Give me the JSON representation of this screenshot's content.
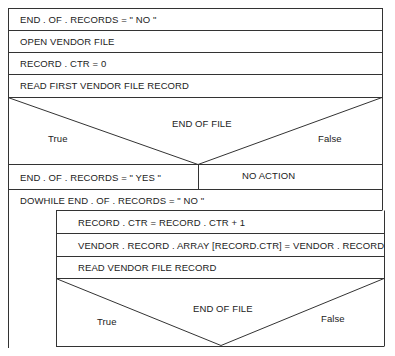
{
  "diagram": {
    "type": "Nassi-Shneiderman structured chart",
    "steps": [
      "END . OF . RECORDS = \" NO \"",
      "OPEN VENDOR FILE",
      "RECORD . CTR = 0",
      "READ FIRST  VENDOR FILE RECORD"
    ],
    "decision1": {
      "condition": "END OF FILE",
      "true_label": "True",
      "false_label": "False",
      "true_action": "END . OF . RECORDS = \" YES \"",
      "false_action": "NO ACTION"
    },
    "loop": {
      "header": "DOWHILE END . OF . RECORDS = \" NO \"",
      "steps": [
        "RECORD . CTR = RECORD . CTR + 1",
        "VENDOR . RECORD . ARRAY [RECORD.CTR] = VENDOR . RECORD",
        "READ VENDOR FILE RECORD"
      ],
      "decision": {
        "condition": "END OF FILE",
        "true_label": "True",
        "false_label": "False"
      }
    }
  }
}
